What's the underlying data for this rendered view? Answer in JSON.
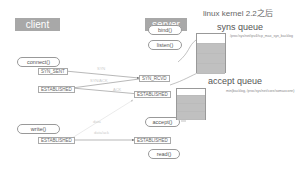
{
  "title": "linux  kernel 2.2之后",
  "client": {
    "header": "client",
    "calls": [
      "connect()",
      "write()"
    ],
    "states": [
      "SYN_SENT",
      "ESTABLISHED",
      "ESTABLISHED"
    ]
  },
  "server": {
    "header": "server",
    "calls": [
      "bind()",
      "listen()",
      "accept()",
      "read()"
    ],
    "states": [
      "SYN_RCVD",
      "ESTABLISHED",
      "ESTABLISHED"
    ]
  },
  "syns_queue": {
    "title": "syns queue",
    "note": "/proc/sys/net/ipv4/tcp_max_syn_backlog",
    "rows": 4
  },
  "accept_queue": {
    "title": "accept queue",
    "note": "min(backlog, /proc/sys/net/core/somaxconn)",
    "rows": 4
  },
  "messages": {
    "syn": "SYN",
    "synack": "SYN/ACK",
    "ack": "ACK",
    "data": "data",
    "data_ack": "data/ack"
  }
}
